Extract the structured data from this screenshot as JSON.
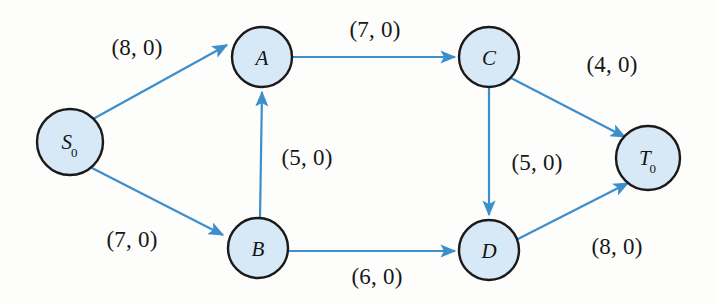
{
  "diagram": {
    "type": "directed-network-flow",
    "colors": {
      "node_fill": "#d7e9f6",
      "node_stroke": "#1a1a1a",
      "edge": "#3d8fcc",
      "text": "#141414",
      "background": "#fdfdfc"
    },
    "nodes": [
      {
        "id": "S0",
        "label": "S",
        "subscript": "0",
        "cx": 70,
        "cy": 142,
        "r": 33
      },
      {
        "id": "A",
        "label": "A",
        "subscript": "",
        "cx": 262,
        "cy": 57,
        "r": 30
      },
      {
        "id": "B",
        "label": "B",
        "subscript": "",
        "cx": 258,
        "cy": 248,
        "r": 30
      },
      {
        "id": "C",
        "label": "C",
        "subscript": "",
        "cx": 489,
        "cy": 57,
        "r": 30
      },
      {
        "id": "D",
        "label": "D",
        "subscript": "",
        "cx": 489,
        "cy": 250,
        "r": 30
      },
      {
        "id": "T0",
        "label": "T",
        "subscript": "0",
        "cx": 648,
        "cy": 158,
        "r": 32
      }
    ],
    "edges": [
      {
        "id": "S0-A",
        "from": "S0",
        "to": "A",
        "label": "(8, 0)",
        "capacity": 8,
        "flow": 0,
        "label_x": 137,
        "label_y": 48
      },
      {
        "id": "S0-B",
        "from": "S0",
        "to": "B",
        "label": "(7, 0)",
        "capacity": 7,
        "flow": 0,
        "label_x": 132,
        "label_y": 240
      },
      {
        "id": "A-C",
        "from": "A",
        "to": "C",
        "label": "(7, 0)",
        "capacity": 7,
        "flow": 0,
        "label_x": 375,
        "label_y": 30
      },
      {
        "id": "B-A",
        "from": "B",
        "to": "A",
        "label": "(5, 0)",
        "capacity": 5,
        "flow": 0,
        "label_x": 307,
        "label_y": 158
      },
      {
        "id": "B-D",
        "from": "B",
        "to": "D",
        "label": "(6, 0)",
        "capacity": 6,
        "flow": 0,
        "label_x": 377,
        "label_y": 277
      },
      {
        "id": "C-T0",
        "from": "C",
        "to": "T0",
        "label": "(4, 0)",
        "capacity": 4,
        "flow": 0,
        "label_x": 612,
        "label_y": 65
      },
      {
        "id": "C-D",
        "from": "C",
        "to": "D",
        "label": "(5, 0)",
        "capacity": 5,
        "flow": 0,
        "label_x": 537,
        "label_y": 163
      },
      {
        "id": "D-T0",
        "from": "D",
        "to": "T0",
        "label": "(8, 0)",
        "capacity": 8,
        "flow": 0,
        "label_x": 617,
        "label_y": 247
      }
    ]
  }
}
